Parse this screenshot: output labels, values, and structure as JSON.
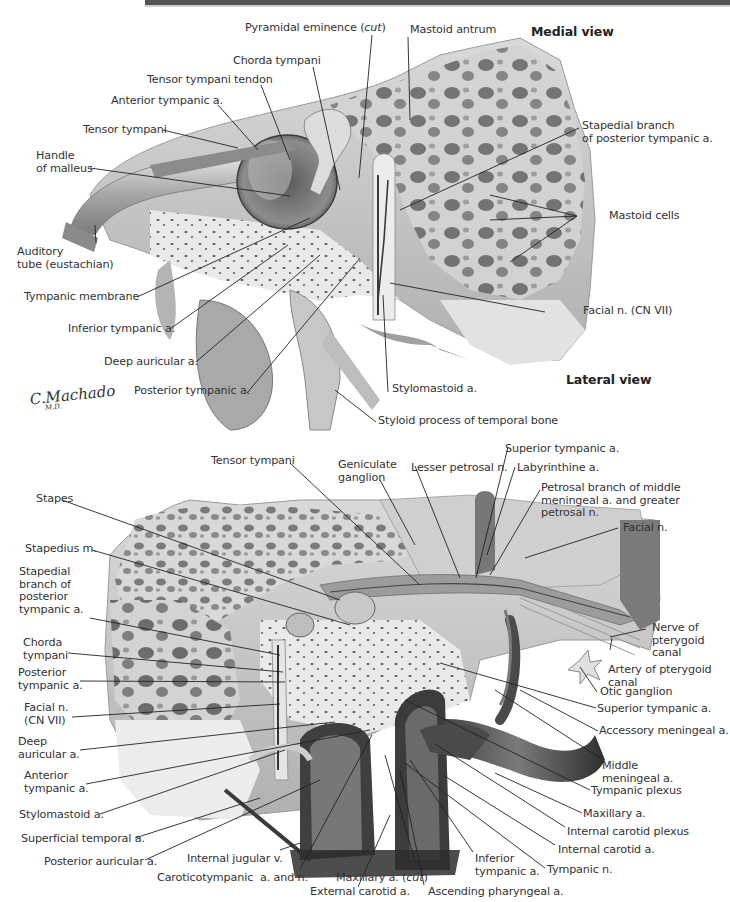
{
  "figure": {
    "views": {
      "top_view_label": "Medial view",
      "bottom_view_label": "Lateral view"
    },
    "signature": {
      "name": "C.Machado",
      "suffix": "M.D."
    },
    "top_panel": {
      "labels": [
        {
          "id": "pyramidal-eminence",
          "text": "Pyramidal eminence (",
          "italic": "cut",
          "close": ")"
        },
        {
          "id": "mastoid-antrum",
          "text": "Mastoid antrum"
        },
        {
          "id": "chorda-tympani",
          "text": "Chorda tympani"
        },
        {
          "id": "tensor-tympani-tendon",
          "text": "Tensor tympani tendon"
        },
        {
          "id": "anterior-tympanic-a",
          "text": "Anterior tympanic a."
        },
        {
          "id": "tensor-tympani",
          "text": "Tensor tympani"
        },
        {
          "id": "handle-of-malleus",
          "text": "Handle\nof malleus"
        },
        {
          "id": "stapedial-branch",
          "text": "Stapedial branch\nof posterior tympanic a."
        },
        {
          "id": "mastoid-cells",
          "text": "Mastoid cells"
        },
        {
          "id": "auditory-tube",
          "text": "Auditory\ntube (eustachian)"
        },
        {
          "id": "tympanic-membrane",
          "text": "Tympanic membrane"
        },
        {
          "id": "inferior-tympanic-a",
          "text": "Inferior tympanic a."
        },
        {
          "id": "facial-n-cn-vii",
          "text": "Facial n. (CN VII)"
        },
        {
          "id": "deep-auricular-a",
          "text": "Deep auricular a."
        },
        {
          "id": "posterior-tympanic-a",
          "text": "Posterior tympanic a."
        },
        {
          "id": "stylomastoid-a",
          "text": "Stylomastoid a."
        },
        {
          "id": "styloid-process",
          "text": "Styloid process of temporal bone"
        }
      ]
    },
    "bottom_panel": {
      "labels": [
        {
          "id": "tensor-tympani",
          "text": "Tensor tympani"
        },
        {
          "id": "geniculate-ganglion",
          "text": "Geniculate\nganglion"
        },
        {
          "id": "lesser-petrosal-n",
          "text": "Lesser petrosal n."
        },
        {
          "id": "superior-tympanic-a-top",
          "text": "Superior tympanic a."
        },
        {
          "id": "labyrinthine-a",
          "text": "Labyrinthine a."
        },
        {
          "id": "petrosal-branch",
          "text": "Petrosal branch of middle\nmeningeal a. and greater\npetrosal n."
        },
        {
          "id": "facial-n",
          "text": "Facial n."
        },
        {
          "id": "stapes",
          "text": "Stapes"
        },
        {
          "id": "stapedius-m",
          "text": "Stapedius m."
        },
        {
          "id": "stapedial-branch",
          "text": "Stapedial\nbranch of\nposterior\ntympanic a."
        },
        {
          "id": "nerve-of-pterygoid-canal",
          "text": "Nerve of\npterygoid\ncanal"
        },
        {
          "id": "artery-of-pterygoid-canal",
          "text": "Artery of pterygoid\ncanal"
        },
        {
          "id": "otic-ganglion",
          "text": "Otic ganglion"
        },
        {
          "id": "chorda-tympani",
          "text": "Chorda\ntympani"
        },
        {
          "id": "posterior-tympanic-a",
          "text": "Posterior\ntympanic a."
        },
        {
          "id": "superior-tympanic-a",
          "text": "Superior tympanic a."
        },
        {
          "id": "accessory-meningeal-a",
          "text": "Accessory meningeal a."
        },
        {
          "id": "facial-n-cn-vii",
          "text": "Facial n.\n(CN VII)"
        },
        {
          "id": "deep-auricular-a",
          "text": "Deep\nauricular a."
        },
        {
          "id": "middle-meningeal-a",
          "text": "Middle\nmeningeal a."
        },
        {
          "id": "anterior-tympanic-a",
          "text": "Anterior\ntympanic a."
        },
        {
          "id": "tympanic-plexus",
          "text": "Tympanic plexus"
        },
        {
          "id": "stylomastoid-a",
          "text": "Stylomastoid a."
        },
        {
          "id": "maxillary-a",
          "text": "Maxillary a."
        },
        {
          "id": "superficial-temporal-a",
          "text": "Superficial temporal a."
        },
        {
          "id": "internal-carotid-plexus",
          "text": "Internal carotid plexus"
        },
        {
          "id": "internal-carotid-a",
          "text": "Internal carotid a."
        },
        {
          "id": "posterior-auricular-a",
          "text": "Posterior auricular a."
        },
        {
          "id": "internal-jugular-v",
          "text": "Internal jugular v."
        },
        {
          "id": "tympanic-n",
          "text": "Tympanic n."
        },
        {
          "id": "inferior-tympanic-a",
          "text": "Inferior\ntympanic a."
        },
        {
          "id": "caroticotympanic",
          "text": "Caroticotympanic  a. and n."
        },
        {
          "id": "maxillary-a-cut",
          "text": "Maxillary a. (",
          "italic": "cut",
          "close": ")"
        },
        {
          "id": "external-carotid-a",
          "text": "External carotid a."
        },
        {
          "id": "ascending-pharyngeal-a",
          "text": "Ascending pharyngeal a."
        }
      ]
    },
    "colors": {
      "bone_light": "#e6e6e6",
      "bone_mid": "#bdbdbd",
      "bone_dark": "#6e6e6e",
      "vessel": "#4a4a4a",
      "leader": "#222222",
      "text": "#333333"
    }
  }
}
